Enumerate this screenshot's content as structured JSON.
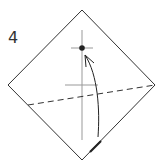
{
  "diagram": {
    "type": "origami-step",
    "step_number": "4",
    "elements": {
      "paper": "square rotated 45° (diamond)",
      "center_crease": "vertical reference line",
      "target_point": "dot marking fold destination",
      "fold_line": "valley fold (dashed)",
      "fold_arrow": "curved arrow from bottom corner to target point"
    },
    "colors": {
      "line": "#333333",
      "crease": "#999999",
      "background": "#ffffff"
    }
  }
}
